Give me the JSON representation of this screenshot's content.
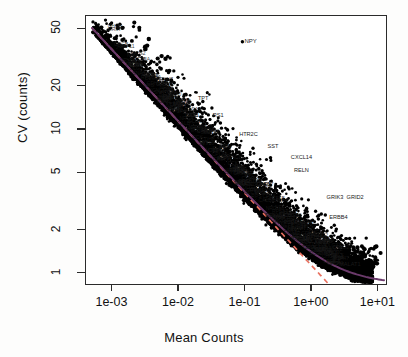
{
  "chart_data": {
    "type": "scatter",
    "title": "",
    "xlabel": "Mean Counts",
    "ylabel": "CV (counts)",
    "xscale": "log",
    "yscale": "log",
    "xlim": [
      0.0004,
      13.0
    ],
    "ylim": [
      0.85,
      62.0
    ],
    "xticks": [
      0.001,
      0.01,
      0.1,
      1,
      10
    ],
    "xticklabels": [
      "1e-03",
      "1e-02",
      "1e-01",
      "1e+00",
      "1e+01"
    ],
    "yticks": [
      1,
      2,
      5,
      10,
      20,
      50
    ],
    "yticklabels": [
      "1",
      "2",
      "5",
      "10",
      "20",
      "50"
    ],
    "grid": false,
    "legend": null,
    "point_color": "#000000",
    "series": [
      {
        "name": "genes",
        "marker": "filled-circle",
        "color": "#000000",
        "n_points_approx": 12000
      }
    ],
    "fits": [
      {
        "name": "poisson-fit",
        "color": "#E8705F",
        "style": "dashed",
        "note": "salmon dashed reference curve falling faster at high mean counts"
      },
      {
        "name": "fitted-trend",
        "color": "#6B3A6B",
        "style": "solid",
        "note": "dark purple solid fitted curve flattening near CV = 1"
      }
    ],
    "annotations": [
      {
        "text": "NPY",
        "x": 0.09,
        "y": 41.0
      },
      {
        "text": "CXCL14",
        "x": 0.45,
        "y": 6.4
      },
      {
        "text": "RELN",
        "x": 0.5,
        "y": 5.2
      },
      {
        "text": "GRID2",
        "x": 3.1,
        "y": 3.35
      },
      {
        "text": "GRIK3",
        "x": 1.55,
        "y": 3.35
      },
      {
        "text": "ERBB4",
        "x": 1.7,
        "y": 2.45
      },
      {
        "text": "HTR2C",
        "x": 0.075,
        "y": 9.3
      },
      {
        "text": "SST",
        "x": 0.2,
        "y": 7.6
      },
      {
        "text": "TPT",
        "x": 0.018,
        "y": 16.5
      },
      {
        "text": "RS1",
        "x": 0.03,
        "y": 12.6
      },
      {
        "text": "GRIN5",
        "x": 0.0042,
        "y": 20.5
      },
      {
        "text": "MALAT1",
        "x": 2.4,
        "y": 1.15
      }
    ]
  },
  "axes": {
    "y": {
      "label": "CV (counts)",
      "ticks": [
        {
          "label": "50",
          "value": 50
        },
        {
          "label": "20",
          "value": 20
        },
        {
          "label": "10",
          "value": 10
        },
        {
          "label": "5",
          "value": 5
        },
        {
          "label": "2",
          "value": 2
        },
        {
          "label": "1",
          "value": 1
        }
      ]
    },
    "x": {
      "label": "Mean Counts",
      "ticks": [
        {
          "label": "1e-03",
          "value": 0.001
        },
        {
          "label": "1e-02",
          "value": 0.01
        },
        {
          "label": "1e-01",
          "value": 0.1
        },
        {
          "label": "1e+00",
          "value": 1
        },
        {
          "label": "1e+01",
          "value": 10
        }
      ]
    }
  },
  "colors": {
    "axis": "#2b2b2b",
    "point": "#000000",
    "fit_dashed": "#E8705F",
    "fit_solid": "#6B3A6B",
    "background": "#ffffff"
  }
}
